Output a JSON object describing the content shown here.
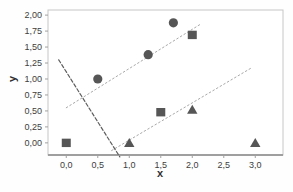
{
  "chart_data": {
    "type": "scatter",
    "title": "",
    "xlabel": "x",
    "ylabel": "y",
    "x_ticks": [
      "0,0",
      "0,5",
      "1,0",
      "1,5",
      "2,0",
      "2,5",
      "3,0"
    ],
    "x_tick_values": [
      0,
      0.5,
      1.0,
      1.5,
      2.0,
      2.5,
      3.0
    ],
    "y_ticks": [
      "2,00",
      "1,75",
      "1,50",
      "1,25",
      "1,00",
      "0,75",
      "0,50",
      "0,25",
      "0,00"
    ],
    "y_tick_values": [
      2.0,
      1.75,
      1.5,
      1.25,
      1.0,
      0.75,
      0.5,
      0.25,
      0.0
    ],
    "xlim": [
      -0.29,
      3.44
    ],
    "ylim": [
      -0.19,
      2.08
    ],
    "grid": "off",
    "legend": "none",
    "decimal_separator": "comma",
    "frame_color": "#c6c6c6",
    "axis_line_color": "#9f9f9f",
    "tick_color": "#a0a0a0",
    "label_color": "#3d3d3d",
    "marker_color": "#565656",
    "trendline_color": "#a8a8a8",
    "dashed_line_color": "#5e5e5e",
    "series": [
      {
        "name": "circle-series",
        "marker": "circle",
        "color": "#565656",
        "points": [
          [
            0.5,
            1.0
          ],
          [
            1.3,
            1.38
          ],
          [
            1.7,
            1.88
          ]
        ]
      },
      {
        "name": "square-series",
        "marker": "square",
        "color": "#565656",
        "points": [
          [
            0.0,
            0.0
          ],
          [
            1.5,
            0.48
          ],
          [
            2.0,
            1.69
          ]
        ]
      },
      {
        "name": "triangle-series",
        "marker": "triangle",
        "color": "#565656",
        "points": [
          [
            1.0,
            0.0
          ],
          [
            2.0,
            0.52
          ],
          [
            3.0,
            0.0
          ]
        ]
      }
    ],
    "lines": [
      {
        "name": "upper-trendline",
        "style": "dotted",
        "color": "#a8a8a8",
        "from": [
          0.0,
          0.55
        ],
        "to": [
          2.15,
          1.87
        ]
      },
      {
        "name": "lower-trendline",
        "style": "dotted",
        "color": "#a8a8a8",
        "from": [
          0.72,
          -0.12
        ],
        "to": [
          2.95,
          1.18
        ]
      },
      {
        "name": "descending-dashed-line",
        "style": "dashed",
        "color": "#5e5e5e",
        "from": [
          -0.12,
          1.3
        ],
        "to": [
          0.85,
          -0.22
        ]
      }
    ]
  }
}
